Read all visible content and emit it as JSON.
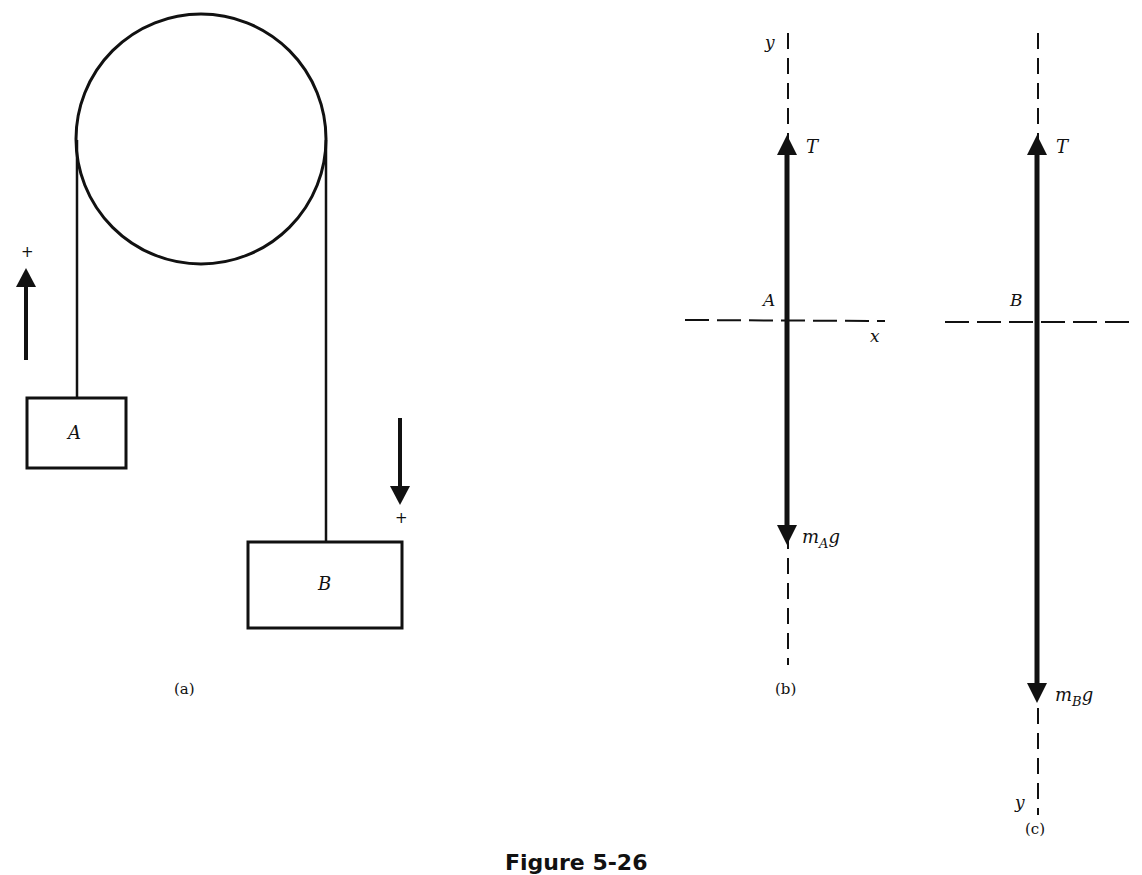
{
  "figure": {
    "caption": "Figure 5-26",
    "panels": {
      "a": {
        "label": "(a)",
        "pulley": {
          "cx": 201,
          "cy": 139,
          "r": 125
        },
        "block_A": {
          "label": "A"
        },
        "block_B": {
          "label": "B"
        },
        "left_direction": {
          "sign": "+",
          "direction": "up"
        },
        "right_direction": {
          "sign": "+",
          "direction": "down"
        }
      },
      "b": {
        "label": "(b)",
        "body": "A",
        "axes": {
          "x_label": "x",
          "y_label": "y"
        },
        "forces": [
          {
            "name": "T",
            "direction": "up"
          },
          {
            "name_main": "m",
            "name_sub": "A",
            "name_tail": "g",
            "direction": "down"
          }
        ]
      },
      "c": {
        "label": "(c)",
        "body": "B",
        "axes": {
          "y_label": "y"
        },
        "forces": [
          {
            "name": "T",
            "direction": "up"
          },
          {
            "name_main": "m",
            "name_sub": "B",
            "name_tail": "g",
            "direction": "down"
          }
        ]
      }
    },
    "colors": {
      "ink": "#111111",
      "background": "#ffffff"
    }
  }
}
